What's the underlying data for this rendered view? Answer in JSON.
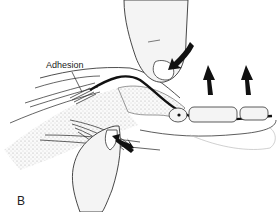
{
  "figure": {
    "panel_label": "B",
    "annotation_label": "Adhesion",
    "arrows": [
      {
        "name": "pressure-arrow-top",
        "direction": "down-left"
      },
      {
        "name": "pressure-arrow-bottom",
        "direction": "up-left"
      },
      {
        "name": "lift-arrow-1",
        "direction": "up"
      },
      {
        "name": "lift-arrow-2",
        "direction": "up"
      }
    ],
    "colors": {
      "ink": "#111111",
      "stipple": "#bdbdbd",
      "skin_fill": "#f2f2f2",
      "background": "#ffffff"
    }
  }
}
